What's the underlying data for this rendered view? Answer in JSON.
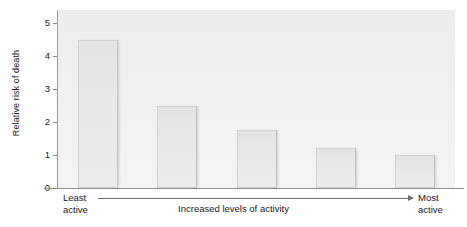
{
  "chart_data": {
    "type": "bar",
    "title": "",
    "subtitle": "",
    "xlabel": "Increased levels of activity",
    "ylabel": "Relative risk of death",
    "categories": [
      "1",
      "2",
      "3",
      "4",
      "5"
    ],
    "values": [
      4.5,
      2.5,
      1.75,
      1.2,
      1.0
    ],
    "ylim": [
      0,
      5.4
    ],
    "yticks": [
      0,
      1,
      2,
      3,
      4,
      5
    ],
    "ytick_labels": [
      "0",
      "1",
      "2",
      "3",
      "4",
      "5"
    ],
    "grid": false,
    "legend": null,
    "annotations": {
      "left_end": "Least\nactive",
      "left_end_line1": "Least",
      "left_end_line2": "active",
      "right_end": "Most\nactive",
      "right_end_line1": "Most",
      "right_end_line2": "active",
      "axis_arrow": "right"
    },
    "colors": {
      "plot_background": "#eef0f0",
      "bar_fill": "#e7e8e8",
      "bar_border": "#cfd0d0",
      "axis_line": "#8f8f8f",
      "text": "#1a1a1a"
    }
  },
  "axis": {
    "y_title": "Relative risk of death",
    "x_caption": "Increased levels of activity",
    "left_label_line1": "Least",
    "left_label_line2": "active",
    "right_label_line1": "Most",
    "right_label_line2": "active"
  }
}
